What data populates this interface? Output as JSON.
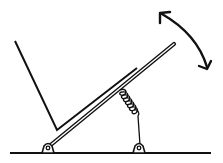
{
  "diagram": {
    "kind": "mechanical-sketch",
    "colors": {
      "background": "#ffffff",
      "stroke": "#111111",
      "bar_fill": "#ffffff"
    },
    "elements": {
      "ground": {
        "icon": "ground-line"
      },
      "pivots": [
        {
          "icon": "pivot-hinge-left"
        },
        {
          "icon": "pivot-hinge-right"
        }
      ],
      "hinged_bar": {
        "icon": "double-line-bar"
      },
      "frame": {
        "icon": "v-shaped-frame"
      },
      "spring": {
        "icon": "coil-spring"
      },
      "motion_arrow": {
        "icon": "double-headed-arc-arrow"
      }
    }
  }
}
